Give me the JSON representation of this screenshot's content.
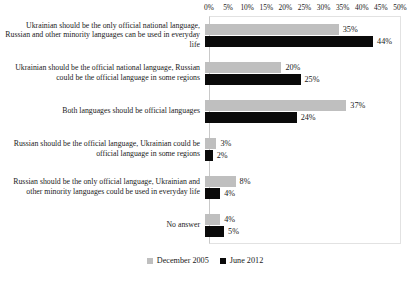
{
  "chart_data": {
    "type": "bar",
    "orientation": "horizontal",
    "title": "",
    "xlabel": "",
    "ylabel": "",
    "xlim": [
      0,
      50
    ],
    "xunit": "%",
    "grid": false,
    "legend_position": "bottom-center",
    "axis_position": "top",
    "tick_labels": [
      "0%",
      "5%",
      "10%",
      "15%",
      "20%",
      "25%",
      "30%",
      "35%",
      "40%",
      "45%",
      "50%"
    ],
    "tick_values": [
      0,
      5,
      10,
      15,
      20,
      25,
      30,
      35,
      40,
      45,
      50
    ],
    "categories": [
      "Ukrainian should be the only official national language, Russian and other minority languages can be used in everyday life",
      "Ukrainian should be the official national language, Russian could be the official language in some regions",
      "Both languages should be official languages",
      "Russian should be the official language, Ukrainian could be official language in some regions",
      "Russian should be the only official language, Ukrainian and other minority languages could be used in everyday life",
      "No answer"
    ],
    "series": [
      {
        "name": "December 2005",
        "color": "#BFBFBF",
        "values": [
          35,
          20,
          37,
          3,
          8,
          4
        ],
        "labels": [
          "35%",
          "20%",
          "37%",
          "3%",
          "8%",
          "4%"
        ]
      },
      {
        "name": "June 2012",
        "color": "#0A0A0A",
        "values": [
          44,
          25,
          24,
          2,
          4,
          5
        ],
        "labels": [
          "44%",
          "25%",
          "24%",
          "2%",
          "4%",
          "5%"
        ]
      }
    ]
  },
  "legend": {
    "items": [
      {
        "label": "December 2005",
        "swatch": "light-gray-square"
      },
      {
        "label": "June 2012",
        "swatch": "black-square"
      }
    ]
  }
}
